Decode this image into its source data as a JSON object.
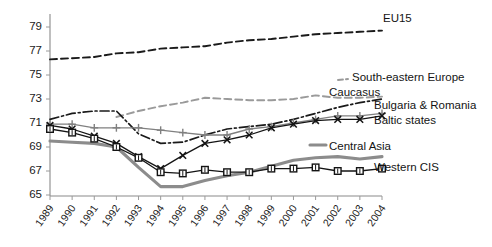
{
  "chart_data": {
    "type": "line",
    "title": "",
    "subtitle": "",
    "xlabel": "",
    "ylabel": "",
    "grid": false,
    "legend_position": "right-inline",
    "x": [
      "1989",
      "1990",
      "1991",
      "1992",
      "1993",
      "1994",
      "1995",
      "1996",
      "1997",
      "1998",
      "1999",
      "2000",
      "2001",
      "2002",
      "2003",
      "2004"
    ],
    "xlim": [
      1989,
      2004
    ],
    "ylim": [
      65,
      80
    ],
    "yticks": [
      65,
      67,
      69,
      71,
      73,
      75,
      77,
      79
    ],
    "series": [
      {
        "name": "EU15",
        "label": "EU15",
        "color": "#1a1a1a",
        "style": "dashed",
        "marker": "none",
        "values": [
          76.3,
          76.4,
          76.5,
          76.8,
          76.9,
          77.2,
          77.3,
          77.4,
          77.7,
          77.9,
          78.0,
          78.2,
          78.4,
          78.5,
          78.6,
          78.7
        ]
      },
      {
        "name": "South-eastern Europe",
        "label": "South-eastern Europe",
        "color": "#9a9a9a",
        "style": "dashed",
        "marker": "none",
        "values": [
          null,
          null,
          null,
          71.5,
          72.0,
          72.4,
          72.7,
          73.1,
          73.0,
          72.9,
          72.9,
          73.0,
          73.3,
          73.1,
          73.1,
          73.2
        ]
      },
      {
        "name": "Caucasus",
        "label": "Caucasus",
        "color": "#1a1a1a",
        "style": "dashdot",
        "marker": "none",
        "values": [
          71.3,
          71.8,
          72.0,
          72.0,
          70.1,
          69.3,
          69.4,
          70.0,
          70.5,
          70.7,
          70.9,
          71.3,
          71.8,
          72.3,
          72.7,
          73.0
        ]
      },
      {
        "name": "Bulgaria & Romania",
        "label": "Bulgaria & Romania",
        "color": "#808080",
        "style": "solid-marker",
        "marker": "plus",
        "values": [
          70.9,
          70.9,
          70.6,
          70.6,
          70.6,
          70.4,
          70.2,
          70.0,
          70.0,
          70.5,
          70.7,
          71.0,
          71.3,
          71.6,
          71.6,
          71.8
        ]
      },
      {
        "name": "Baltic states",
        "label": "Baltic states",
        "color": "#141414",
        "style": "solid-marker",
        "marker": "x",
        "values": [
          70.8,
          70.5,
          69.9,
          69.3,
          68.2,
          67.2,
          68.3,
          69.3,
          69.6,
          70.0,
          70.6,
          70.9,
          71.2,
          71.3,
          71.3,
          71.6
        ]
      },
      {
        "name": "Central Asia",
        "label": "Central Asia",
        "color": "#8c8c8c",
        "style": "solid-thick",
        "marker": "none",
        "values": [
          69.5,
          69.4,
          69.3,
          69.0,
          67.3,
          65.7,
          65.7,
          66.2,
          66.6,
          66.9,
          67.4,
          67.9,
          68.1,
          68.2,
          68.0,
          68.2
        ]
      },
      {
        "name": "Western CIS",
        "label": "Western CIS",
        "color": "#141414",
        "style": "solid-marker",
        "marker": "square",
        "values": [
          70.5,
          70.2,
          69.7,
          69.0,
          68.1,
          66.9,
          66.8,
          67.1,
          66.9,
          66.9,
          67.2,
          67.2,
          67.3,
          67.0,
          67.0,
          67.2
        ]
      }
    ],
    "annotations": [
      {
        "name": "EU15",
        "text": "EU15",
        "x_px": 383,
        "y_px": 19
      },
      {
        "name": "South-eastern Europe",
        "text": "South-eastern Europe",
        "x_px": 352,
        "y_px": 78
      },
      {
        "name": "Caucasus",
        "text": "Caucasus",
        "x_px": 329,
        "y_px": 93
      },
      {
        "name": "Bulgaria & Romania",
        "text": "Bulgaria & Romania",
        "x_px": 374,
        "y_px": 106
      },
      {
        "name": "Baltic states",
        "text": "Baltic states",
        "x_px": 374,
        "y_px": 121
      },
      {
        "name": "Central Asia",
        "text": "Central Asia",
        "x_px": 329,
        "y_px": 147
      },
      {
        "name": "Western CIS",
        "text": "Western CIS",
        "x_px": 374,
        "y_px": 168
      }
    ]
  },
  "axes": {
    "y_tick_labels": [
      "79",
      "77",
      "75",
      "73",
      "71",
      "69",
      "67",
      "65"
    ],
    "x_tick_labels": [
      "1989",
      "1990",
      "1991",
      "1992",
      "1993",
      "1994",
      "1995",
      "1996",
      "1997",
      "1998",
      "1999",
      "2000",
      "2001",
      "2002",
      "2003",
      "2004"
    ]
  },
  "colors": {
    "background": "#ffffff",
    "axis": "#8a8a8a",
    "text": "#1a1a1a",
    "dark_series": "#1a1a1a",
    "gray_series": "#8c8c8c"
  }
}
